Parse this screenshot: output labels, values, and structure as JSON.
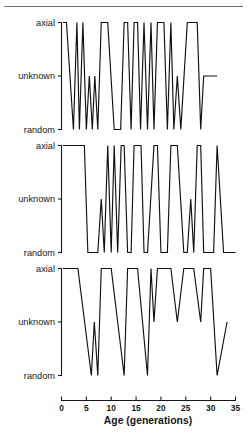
{
  "chart_data": {
    "type": "line",
    "title": "",
    "subtitle": "",
    "xlabel": "Age (generations)",
    "ylabel": "",
    "xlim": [
      0,
      35
    ],
    "xticks": [
      0,
      5,
      10,
      15,
      20,
      25,
      30,
      35
    ],
    "xticklabels": [
      "0",
      "5",
      "10",
      "15",
      "20",
      "25",
      "30",
      "35"
    ],
    "ycategories": [
      "random",
      "unknown",
      "axial"
    ],
    "yticklabels": [
      "axial",
      "unknown",
      "random"
    ],
    "grid": false,
    "legend": null,
    "panels": [
      {
        "name": "panel-1",
        "yticklabels": [
          "axial",
          "unknown",
          "random"
        ],
        "series": [
          {
            "name": "orientation",
            "x": [
              0.3,
              1.0,
              2.4,
              3.1,
              3.6,
              4.3,
              5.0,
              5.6,
              6.2,
              6.7,
              7.3,
              8.0,
              8.6,
              9.3,
              10.6,
              11.9,
              12.6,
              13.3,
              14.0,
              14.6,
              15.3,
              15.9,
              16.6,
              17.3,
              18.0,
              18.6,
              19.3,
              20.6,
              21.3,
              22.0,
              22.6,
              23.3,
              24.0,
              25.3,
              26.6,
              27.3,
              28.0,
              28.6,
              29.3,
              30.6,
              31.3
            ],
            "values": [
              "axial",
              "axial",
              "random",
              "axial",
              "random",
              "axial",
              "random",
              "unknown",
              "random",
              "unknown",
              "random",
              "axial",
              "axial",
              "axial",
              "random",
              "random",
              "axial",
              "axial",
              "random",
              "axial",
              "axial",
              "random",
              "axial",
              "random",
              "axial",
              "random",
              "axial",
              "axial",
              "random",
              "axial",
              "random",
              "unknown",
              "random",
              "axial",
              "axial",
              "axial",
              "random",
              "unknown",
              "unknown",
              "unknown",
              "unknown"
            ]
          }
        ]
      },
      {
        "name": "panel-2",
        "yticklabels": [
          "axial",
          "unknown",
          "random"
        ],
        "series": [
          {
            "name": "orientation",
            "x": [
              0.3,
              1.0,
              4.0,
              4.6,
              5.3,
              7.3,
              8.0,
              8.6,
              9.3,
              10.0,
              10.6,
              11.3,
              12.0,
              12.6,
              13.3,
              14.0,
              14.6,
              16.0,
              16.6,
              17.3,
              18.6,
              19.3,
              20.0,
              21.3,
              22.0,
              23.3,
              24.6,
              25.3,
              26.0,
              26.6,
              27.3,
              28.0,
              28.6,
              29.3,
              30.6,
              31.3,
              32.6,
              33.3,
              35.0
            ],
            "values": [
              "axial",
              "axial",
              "axial",
              "axial",
              "random",
              "random",
              "unknown",
              "random",
              "axial",
              "random",
              "axial",
              "random",
              "axial",
              "axial",
              "random",
              "random",
              "axial",
              "axial",
              "random",
              "random",
              "axial",
              "axial",
              "random",
              "random",
              "axial",
              "axial",
              "random",
              "random",
              "unknown",
              "random",
              "axial",
              "axial",
              "random",
              "random",
              "random",
              "axial",
              "random",
              "random",
              "random"
            ]
          }
        ]
      },
      {
        "name": "panel-3",
        "yticklabels": [
          "axial",
          "unknown",
          "random"
        ],
        "series": [
          {
            "name": "orientation",
            "x": [
              0.3,
              1.0,
              2.6,
              3.3,
              6.0,
              6.6,
              7.3,
              8.0,
              9.3,
              10.0,
              12.6,
              13.3,
              14.6,
              15.3,
              17.3,
              18.0,
              18.6,
              19.3,
              20.0,
              21.3,
              22.0,
              23.3,
              24.6,
              25.3,
              26.0,
              26.6,
              28.0,
              28.6,
              30.0,
              31.3,
              33.3
            ],
            "values": [
              "axial",
              "axial",
              "axial",
              "axial",
              "random",
              "unknown",
              "random",
              "axial",
              "axial",
              "axial",
              "random",
              "axial",
              "axial",
              "axial",
              "random",
              "axial",
              "unknown",
              "axial",
              "axial",
              "axial",
              "axial",
              "unknown",
              "axial",
              "axial",
              "axial",
              "axial",
              "unknown",
              "axial",
              "axial",
              "random",
              "unknown"
            ]
          }
        ]
      }
    ]
  },
  "axis": {
    "x_title": "Age (generations)",
    "tick_labels": [
      "0",
      "5",
      "10",
      "15",
      "20",
      "25",
      "30",
      "35"
    ],
    "y_top": "axial",
    "y_mid": "unknown",
    "y_bot": "random"
  }
}
